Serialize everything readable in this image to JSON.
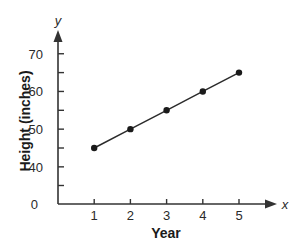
{
  "chart_data": {
    "type": "line",
    "title": "",
    "xlabel": "Year",
    "ylabel": "Height (inches)",
    "x_axis_var": "x",
    "y_axis_var": "y",
    "x": [
      1,
      2,
      3,
      4,
      5
    ],
    "series": [
      {
        "name": "Height",
        "values": [
          45,
          50,
          55,
          60,
          65
        ],
        "markers": true
      }
    ],
    "x_ticks": [
      1,
      2,
      3,
      4,
      5
    ],
    "y_ticks": [
      0,
      40,
      50,
      60,
      70
    ],
    "y_minor_ticks": [
      35,
      45,
      55,
      65
    ],
    "y_axis_break": true,
    "xlim": [
      0,
      5.8
    ],
    "ylim": [
      30,
      74
    ],
    "grid": false,
    "legend": null,
    "colors": {
      "axis": "#333333",
      "line": "#2b2b2b",
      "marker": "#1a1a1a",
      "text": "#1a1a1a"
    }
  }
}
